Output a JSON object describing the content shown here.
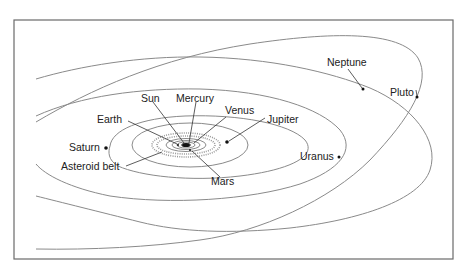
{
  "diagram": {
    "colors": {
      "frame": "#6a6a6a",
      "orbit": "#8a8a8a",
      "text": "#222222",
      "planet": "#111111"
    },
    "labels": {
      "sun": "Sun",
      "mercury": "Mercury",
      "venus": "Venus",
      "earth": "Earth",
      "mars": "Mars",
      "asteroid_belt": "Asteroid belt",
      "jupiter": "Jupiter",
      "saturn": "Saturn",
      "uranus": "Uranus",
      "neptune": "Neptune",
      "pluto": "Pluto"
    }
  }
}
